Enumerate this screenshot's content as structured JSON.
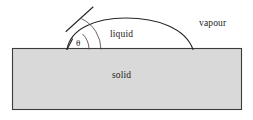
{
  "figure": {
    "type": "diagram",
    "canvas": {
      "width": 253,
      "height": 120,
      "background": "#ffffff"
    },
    "colors": {
      "solid_fill": "#d9d9d9",
      "solid_stroke": "#3c3c3c",
      "curve_stroke": "#262626",
      "tangent_stroke": "#262626",
      "arc_stroke": "#4a4a4a",
      "text": "#1a1a1a"
    },
    "labels": {
      "liquid": "liquid",
      "vapour": "vapour",
      "solid": "solid",
      "contact_angle_symbol": "θ"
    },
    "geometry": {
      "solid_rect": {
        "x": 12,
        "y": 48,
        "width": 230,
        "height": 62
      },
      "droplet": {
        "left_contact": {
          "x": 67,
          "y": 49.5
        },
        "apex": {
          "x": 126,
          "y": 18
        },
        "right_contact": {
          "x": 193,
          "y": 49.5
        }
      },
      "tangent_line": {
        "from": {
          "x": 66,
          "y": 30
        },
        "to": {
          "x": 93,
          "y": 7
        }
      },
      "angle_arc": {
        "vertex": {
          "x": 67,
          "y": 49.5
        },
        "radius": 11,
        "start_deg": 0,
        "end_deg": 40
      },
      "droplet_arc_gauge": {
        "vertex": {
          "x": 67,
          "y": 49.5
        },
        "radius": 34
      }
    }
  }
}
